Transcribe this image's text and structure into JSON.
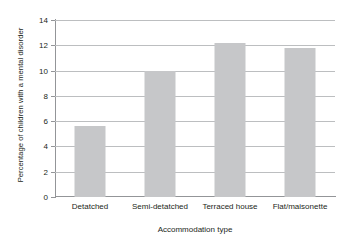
{
  "chart_data": {
    "type": "bar",
    "title": "",
    "categories": [
      "Detatched",
      "Semi-detatched",
      "Terraced house",
      "Flat/maisonette"
    ],
    "values": [
      5.6,
      10.0,
      12.2,
      11.8
    ],
    "xlabel": "Accommodation type",
    "ylabel": "Percentage of children with a mental disorder",
    "ylim": [
      0,
      14
    ],
    "yticks": [
      0,
      2,
      4,
      6,
      8,
      10,
      12,
      14
    ],
    "ytick_labels": [
      "0",
      "2",
      "4",
      "6",
      "8",
      "10",
      "12",
      "14"
    ],
    "grid": true,
    "legend": false,
    "bar_color": "#c6c7c9",
    "axis_color": "#939598",
    "grid_color": "#bcbec0",
    "text_color": "#231f20",
    "background": "#ffffff"
  }
}
